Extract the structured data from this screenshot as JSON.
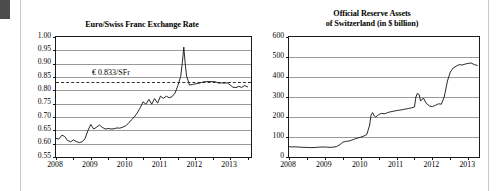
{
  "page": {
    "background_color": "#ffffff",
    "corner_block_color": "#4c4c4c",
    "rule_color": "#c8c8c8"
  },
  "chart_data": [
    {
      "id": "euro-swiss-franc-exchange-rate",
      "type": "line",
      "title": "Euro/Swiss Franc Exchange Rate",
      "xlabel": "",
      "ylabel": "",
      "xlim": [
        2008.0,
        2013.6
      ],
      "ylim": [
        0.55,
        1.0
      ],
      "ytick_labels": [
        "1.00",
        "0.95",
        "0.90",
        "0.85",
        "0.80",
        "0.75",
        "0.70",
        "0.65",
        "0.60",
        "0.55"
      ],
      "ytick_values": [
        1.0,
        0.95,
        0.9,
        0.85,
        0.8,
        0.75,
        0.7,
        0.65,
        0.6,
        0.55
      ],
      "xtick_labels": [
        "2008",
        "2009",
        "2010",
        "2011",
        "2012",
        "2013"
      ],
      "xtick_values": [
        2008,
        2009,
        2010,
        2011,
        2012,
        2013
      ],
      "minor_xticks": [
        2008.5,
        2009.5,
        2010.5,
        2011.5,
        2012.5,
        2013.5
      ],
      "grid": true,
      "legend": "none",
      "line_color": "#111111",
      "annotation": {
        "text": "€ 0.833/SFr",
        "value": 0.833,
        "style": "dashed",
        "color": "#333333"
      },
      "x": [
        2008.0,
        2008.08,
        2008.17,
        2008.25,
        2008.33,
        2008.42,
        2008.5,
        2008.58,
        2008.67,
        2008.75,
        2008.83,
        2008.92,
        2009.0,
        2009.08,
        2009.17,
        2009.25,
        2009.33,
        2009.42,
        2009.5,
        2009.58,
        2009.67,
        2009.75,
        2009.83,
        2009.92,
        2010.0,
        2010.08,
        2010.17,
        2010.25,
        2010.33,
        2010.42,
        2010.5,
        2010.58,
        2010.67,
        2010.75,
        2010.83,
        2010.92,
        2011.0,
        2011.08,
        2011.17,
        2011.25,
        2011.33,
        2011.42,
        2011.5,
        2011.58,
        2011.63,
        2011.67,
        2011.71,
        2011.75,
        2011.79,
        2011.83,
        2011.92,
        2012.0,
        2012.08,
        2012.17,
        2012.25,
        2012.33,
        2012.42,
        2012.5,
        2012.58,
        2012.67,
        2012.75,
        2012.83,
        2012.92,
        2013.0,
        2013.08,
        2013.17,
        2013.25,
        2013.33,
        2013.42,
        2013.5
      ],
      "values": [
        0.62,
        0.617,
        0.632,
        0.627,
        0.612,
        0.607,
        0.614,
        0.608,
        0.604,
        0.607,
        0.618,
        0.65,
        0.672,
        0.655,
        0.662,
        0.67,
        0.661,
        0.655,
        0.657,
        0.655,
        0.656,
        0.659,
        0.658,
        0.662,
        0.667,
        0.676,
        0.69,
        0.7,
        0.715,
        0.735,
        0.757,
        0.748,
        0.766,
        0.748,
        0.769,
        0.752,
        0.778,
        0.77,
        0.778,
        0.772,
        0.776,
        0.79,
        0.818,
        0.852,
        0.905,
        0.962,
        0.9,
        0.853,
        0.838,
        0.82,
        0.822,
        0.824,
        0.826,
        0.829,
        0.832,
        0.833,
        0.833,
        0.833,
        0.832,
        0.827,
        0.828,
        0.827,
        0.828,
        0.82,
        0.812,
        0.81,
        0.815,
        0.811,
        0.818,
        0.813
      ]
    },
    {
      "id": "official-reserve-assets-of-switzerland",
      "type": "line",
      "title": "Official Reserve Assets\nof Switzerland (in $ billion)",
      "title_line1": "Official Reserve Assets",
      "title_line2": "of Switzerland (in $ billion)",
      "xlabel": "",
      "ylabel": "",
      "xlim": [
        2008.0,
        2013.3
      ],
      "ylim": [
        0,
        600
      ],
      "ytick_labels": [
        "600",
        "500",
        "400",
        "300",
        "200",
        "100",
        "0"
      ],
      "ytick_values": [
        600,
        500,
        400,
        300,
        200,
        100,
        0
      ],
      "xtick_labels": [
        "2008",
        "2009",
        "2010",
        "2011",
        "2012",
        "2013"
      ],
      "xtick_values": [
        2008,
        2009,
        2010,
        2011,
        2012,
        2013
      ],
      "minor_xticks": [
        2008.5,
        2009.5,
        2010.5,
        2011.5,
        2012.5
      ],
      "grid": true,
      "legend": "none",
      "line_color": "#111111",
      "x": [
        2008.0,
        2008.08,
        2008.17,
        2008.25,
        2008.33,
        2008.42,
        2008.5,
        2008.58,
        2008.67,
        2008.75,
        2008.83,
        2008.92,
        2009.0,
        2009.08,
        2009.17,
        2009.25,
        2009.33,
        2009.42,
        2009.5,
        2009.58,
        2009.67,
        2009.75,
        2009.83,
        2009.92,
        2010.0,
        2010.08,
        2010.17,
        2010.25,
        2010.29,
        2010.33,
        2010.38,
        2010.42,
        2010.5,
        2010.58,
        2010.67,
        2010.75,
        2010.83,
        2010.92,
        2011.0,
        2011.08,
        2011.17,
        2011.25,
        2011.33,
        2011.42,
        2011.5,
        2011.54,
        2011.58,
        2011.63,
        2011.67,
        2011.75,
        2011.83,
        2011.92,
        2012.0,
        2012.08,
        2012.17,
        2012.25,
        2012.33,
        2012.42,
        2012.5,
        2012.58,
        2012.67,
        2012.75,
        2012.83,
        2012.92,
        2013.0,
        2013.08,
        2013.17,
        2013.25
      ],
      "values": [
        52,
        50,
        51,
        50,
        49,
        48,
        48,
        47,
        47,
        48,
        49,
        50,
        50,
        49,
        48,
        50,
        52,
        62,
        74,
        78,
        80,
        84,
        90,
        95,
        99,
        104,
        112,
        160,
        210,
        222,
        205,
        200,
        212,
        218,
        216,
        222,
        226,
        229,
        232,
        234,
        237,
        240,
        242,
        246,
        250,
        300,
        318,
        312,
        280,
        295,
        268,
        255,
        252,
        258,
        266,
        264,
        300,
        380,
        425,
        445,
        455,
        462,
        460,
        465,
        468,
        470,
        462,
        458
      ]
    }
  ]
}
